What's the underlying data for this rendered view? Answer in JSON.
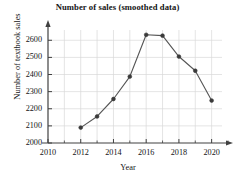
{
  "chart_data": {
    "type": "line",
    "title": "Number of sales (smoothed data)",
    "xlabel": "Year",
    "ylabel": "Number of textbook sales",
    "x": [
      2012,
      2013,
      2014,
      2015,
      2016,
      2017,
      2018,
      2019,
      2020
    ],
    "values": [
      2090,
      2155,
      2257,
      2388,
      2632,
      2627,
      2505,
      2422,
      2248
    ],
    "series": [
      {
        "name": "Number of textbook sales",
        "values": [
          2090,
          2155,
          2257,
          2388,
          2632,
          2627,
          2505,
          2422,
          2248
        ]
      }
    ],
    "xlim": [
      2010,
      2021
    ],
    "ylim": [
      2000,
      2660
    ],
    "xticks": [
      2010,
      2012,
      2014,
      2016,
      2018,
      2020
    ],
    "xtick_labels": [
      "2010",
      "2012",
      "2014",
      "2016",
      "2018",
      "2020"
    ],
    "xminor_ticks": [
      2011,
      2013,
      2015,
      2017,
      2019,
      2021
    ],
    "yticks": [
      2000,
      2100,
      2200,
      2300,
      2400,
      2500,
      2600
    ],
    "ytick_labels": [
      "2000",
      "2100",
      "2200",
      "2300",
      "2400",
      "2500",
      "2600"
    ],
    "grid": true,
    "legend": null,
    "marker": "circle",
    "line_color": "#555555",
    "marker_color": "#3a3a3a",
    "grid_color": "#d9d9d9",
    "axis_color": "#404040",
    "background": "#ffffff"
  }
}
